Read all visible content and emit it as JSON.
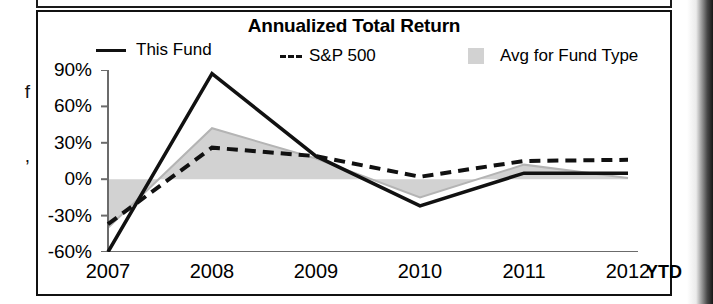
{
  "page": {
    "left_margin_fragments": [
      "f",
      ","
    ],
    "right_edge_artifact": "scan-shadow"
  },
  "chart_data": {
    "type": "line",
    "title": "Annualized Total Return",
    "xlabel": "",
    "ylabel": "",
    "x": [
      "2007",
      "2008",
      "2009",
      "2010",
      "2011",
      "2012"
    ],
    "categories": [
      "2007",
      "2008",
      "2009",
      "2010",
      "2011",
      "2012"
    ],
    "period_note": "YTD",
    "ylim": [
      -60,
      90
    ],
    "yticks": [
      90,
      60,
      30,
      0,
      -30,
      -60
    ],
    "ytick_labels": [
      "90%",
      "60%",
      "30%",
      "0%",
      "-30%",
      "-60%"
    ],
    "grid": false,
    "legend_position": "top",
    "zero_line": 0,
    "series": [
      {
        "name": "This Fund",
        "style": "solid",
        "color": "#111111",
        "values": [
          -60,
          87,
          19,
          -22,
          5,
          5
        ]
      },
      {
        "name": "S&P 500",
        "style": "dashed",
        "color": "#111111",
        "values": [
          -37,
          26,
          19,
          2,
          15,
          16
        ]
      },
      {
        "name": "Avg for Fund Type",
        "style": "band",
        "color": "#d2d2d2",
        "values": [
          -40,
          42,
          17,
          -15,
          12,
          1
        ]
      }
    ]
  },
  "legend": {
    "items": [
      {
        "label": "This Fund",
        "marker": "solid-line"
      },
      {
        "label": "S&P 500",
        "marker": "dashed-line"
      },
      {
        "label": "Avg for Fund Type",
        "marker": "gray-swatch"
      }
    ]
  },
  "axis": {
    "y_labels": [
      "90%",
      "60%",
      "30%",
      "0%",
      "-30%",
      "-60%"
    ],
    "x_labels": [
      "2007",
      "2008",
      "2009",
      "2010",
      "2011",
      "2012"
    ],
    "ytd_label": "YTD"
  }
}
